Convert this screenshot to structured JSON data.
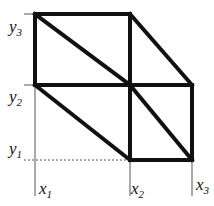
{
  "figure": {
    "background_color": "#ffffff",
    "ink_color": "#111111",
    "thin_line_color": "#555555",
    "axis_labels": {
      "y3": {
        "base": "y",
        "sub": "3",
        "text": "y3"
      },
      "y2": {
        "base": "y",
        "sub": "2",
        "text": "y2"
      },
      "y1": {
        "base": "y",
        "sub": "1",
        "text": "y1"
      },
      "x1": {
        "base": "x",
        "sub": "1",
        "text": "x1"
      },
      "x2": {
        "base": "x",
        "sub": "2",
        "text": "x2"
      },
      "x3": {
        "base": "x",
        "sub": "3",
        "text": "x3"
      }
    }
  },
  "chart_data": {
    "type": "diagram",
    "xlabel": "",
    "ylabel": "",
    "grid": false,
    "legend": false,
    "x_ticks": [
      {
        "name": "x1",
        "label": "x1",
        "pixel": 35
      },
      {
        "name": "x2",
        "label": "x2",
        "pixel": 130
      },
      {
        "name": "x3",
        "label": "x3",
        "pixel": 192
      }
    ],
    "y_ticks": [
      {
        "name": "y1",
        "label": "y1",
        "pixel": 160
      },
      {
        "name": "y2",
        "label": "y2",
        "pixel": 85
      },
      {
        "name": "y3",
        "label": "y3",
        "pixel": 14
      }
    ],
    "nodes": [
      {
        "id": "n11",
        "x": "x1",
        "y": "y1",
        "px": 35,
        "py": 160
      },
      {
        "id": "n21",
        "x": "x2",
        "y": "y1",
        "px": 130,
        "py": 160
      },
      {
        "id": "n31",
        "x": "x3",
        "y": "y1",
        "px": 192,
        "py": 160
      },
      {
        "id": "n12",
        "x": "x1",
        "y": "y2",
        "px": 35,
        "py": 85
      },
      {
        "id": "n22",
        "x": "x2",
        "y": "y2",
        "px": 130,
        "py": 85
      },
      {
        "id": "n32",
        "x": "x3",
        "y": "y2",
        "px": 192,
        "py": 85
      },
      {
        "id": "n13",
        "x": "x1",
        "y": "y3",
        "px": 35,
        "py": 14
      },
      {
        "id": "n23",
        "x": "x2",
        "y": "y3",
        "px": 130,
        "py": 14
      }
    ],
    "thick_edges": [
      {
        "name": "top-edge",
        "from": "n13",
        "to": "n23"
      },
      {
        "name": "left-edge-upper",
        "from": "n13",
        "to": "n12"
      },
      {
        "name": "mid-horizontal",
        "from": "n12",
        "to": "n32"
      },
      {
        "name": "mid-vertical-upper",
        "from": "n23",
        "to": "n22"
      },
      {
        "name": "mid-vertical-lower",
        "from": "n22",
        "to": "n21"
      },
      {
        "name": "right-edge",
        "from": "n32",
        "to": "n31"
      },
      {
        "name": "bottom-edge-right",
        "from": "n21",
        "to": "n31"
      },
      {
        "name": "diagonal-upper-left",
        "from": "n13",
        "to": "n22"
      },
      {
        "name": "diagonal-upper-right",
        "from": "n23",
        "to": "n32"
      },
      {
        "name": "diagonal-lower-left",
        "from": "n12",
        "to": "n21"
      },
      {
        "name": "diagonal-lower-right",
        "from": "n22",
        "to": "n31"
      }
    ],
    "thin_edges": [
      {
        "name": "y-axis-thin",
        "from_px": [
          35,
          85
        ],
        "to_px": [
          35,
          196
        ]
      },
      {
        "name": "bottom-dotted",
        "from_px": [
          24,
          160
        ],
        "to_px": [
          130,
          160
        ]
      },
      {
        "name": "tick-y3",
        "from_px": [
          24,
          14
        ],
        "to_px": [
          38,
          14
        ]
      },
      {
        "name": "tick-y2",
        "from_px": [
          24,
          85
        ],
        "to_px": [
          38,
          85
        ]
      },
      {
        "name": "x2-axis-thin",
        "from_px": [
          130,
          160
        ],
        "to_px": [
          130,
          196
        ]
      },
      {
        "name": "x3-axis-thin",
        "from_px": [
          192,
          160
        ],
        "to_px": [
          192,
          196
        ]
      }
    ]
  }
}
